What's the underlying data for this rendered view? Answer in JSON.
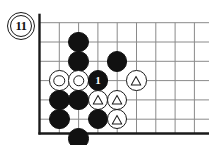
{
  "figure": {
    "kind": "go-board-diagram",
    "label": "11",
    "caption": ""
  },
  "board": {
    "columns": 9,
    "rows": 6,
    "cell_size": 19.3,
    "origin_x": 40,
    "origin_y": 22.7,
    "edges": {
      "left": true,
      "bottom": true,
      "top": false,
      "right": false
    },
    "line_color": "#8a8a8a",
    "edge_color": "#1a1a1a",
    "background": "#ffffff"
  },
  "stones": [
    {
      "id": "b-c2r1",
      "color": "black",
      "col": 2,
      "row": 1,
      "marker": "none",
      "label": ""
    },
    {
      "id": "b-c2r2",
      "color": "black",
      "col": 2,
      "row": 2,
      "marker": "none",
      "label": ""
    },
    {
      "id": "b-c4r2",
      "color": "black",
      "col": 4,
      "row": 2,
      "marker": "none",
      "label": ""
    },
    {
      "id": "w-c1r3",
      "color": "white",
      "col": 1,
      "row": 3,
      "marker": "circle",
      "label": ""
    },
    {
      "id": "w-c2r3",
      "color": "white",
      "col": 2,
      "row": 3,
      "marker": "circle",
      "label": ""
    },
    {
      "id": "b-c3r3",
      "color": "black",
      "col": 3,
      "row": 3,
      "marker": "none",
      "label": "1"
    },
    {
      "id": "w-c5r3",
      "color": "white",
      "col": 5,
      "row": 3,
      "marker": "triangle",
      "label": ""
    },
    {
      "id": "b-c1r4",
      "color": "black",
      "col": 1,
      "row": 4,
      "marker": "none",
      "label": ""
    },
    {
      "id": "b-c2r4",
      "color": "black",
      "col": 2,
      "row": 4,
      "marker": "none",
      "label": ""
    },
    {
      "id": "w-c3r4",
      "color": "white",
      "col": 3,
      "row": 4,
      "marker": "triangle",
      "label": ""
    },
    {
      "id": "w-c4r4",
      "color": "white",
      "col": 4,
      "row": 4,
      "marker": "triangle",
      "label": ""
    },
    {
      "id": "b-c1r5",
      "color": "black",
      "col": 1,
      "row": 5,
      "marker": "none",
      "label": ""
    },
    {
      "id": "b-c3r5",
      "color": "black",
      "col": 3,
      "row": 5,
      "marker": "none",
      "label": ""
    },
    {
      "id": "w-c4r5",
      "color": "white",
      "col": 4,
      "row": 5,
      "marker": "triangle",
      "label": ""
    },
    {
      "id": "b-c2r6",
      "color": "black",
      "col": 2,
      "row": 6,
      "marker": "none",
      "label": ""
    }
  ],
  "legend": {
    "move_number": "1",
    "triangle_symbol": "△",
    "circle_symbol": "○"
  }
}
